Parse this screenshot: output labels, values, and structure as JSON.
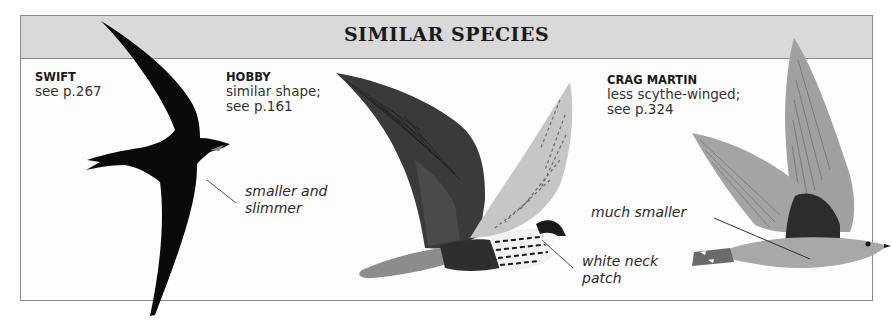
{
  "panel": {
    "title": "SIMILAR SPECIES"
  },
  "species": [
    {
      "name": "SWIFT",
      "description_lines": [
        "see p.267"
      ],
      "note_lines": [
        "smaller and",
        "slimmer"
      ],
      "illustration": "swift-silhouette"
    },
    {
      "name": "HOBBY",
      "description_lines": [
        "similar shape;",
        "see p.161"
      ],
      "note_lines": [
        "white neck",
        "patch"
      ],
      "illustration": "hobby-in-flight"
    },
    {
      "name": "CRAG MARTIN",
      "description_lines": [
        "less scythe-winged;",
        "see p.324"
      ],
      "note_lines": [
        "much smaller"
      ],
      "illustration": "crag-martin-in-flight"
    }
  ],
  "colors": {
    "header_bg": "#d9d9d9",
    "border": "#8a8a8a",
    "swift": "#0a0a0a",
    "hobby_upperwing": "#3c3c3c",
    "hobby_underwing": "#c8c8c8",
    "crag_martin": "#9a9a9a"
  }
}
